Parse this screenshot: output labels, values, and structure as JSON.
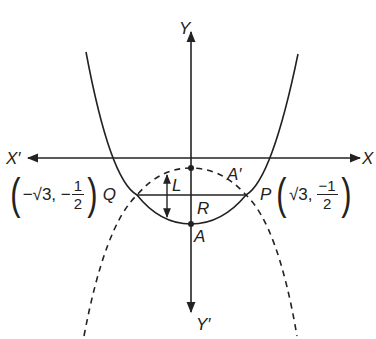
{
  "diagram": {
    "axes": {
      "x_positive_label": "X",
      "x_negative_label": "X′",
      "y_positive_label": "Y",
      "y_negative_label": "Y′"
    },
    "points": {
      "A": "A",
      "A_prime": "A′",
      "R": "R",
      "L": "L",
      "P": {
        "name": "P",
        "x": "√3,",
        "y_num": "−1",
        "y_den": "2"
      },
      "Q": {
        "name": "Q",
        "x": "−√3, −",
        "y_num": "1",
        "y_den": "2"
      }
    },
    "curves": [
      {
        "name": "upward parabola",
        "style": "solid",
        "vertex": "A"
      },
      {
        "name": "downward parabola",
        "style": "dashed",
        "vertex": "A′"
      }
    ],
    "chord": "QP",
    "colors": {
      "stroke": "#222222",
      "background": "#ffffff"
    }
  }
}
